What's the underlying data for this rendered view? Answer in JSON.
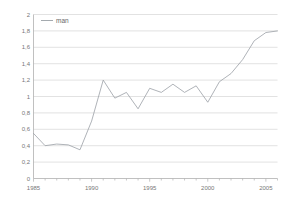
{
  "chart_data": {
    "type": "line",
    "title": "",
    "xlabel": "",
    "ylabel": "",
    "xlim": [
      1985,
      2006
    ],
    "ylim": [
      0,
      2
    ],
    "grid": true,
    "grid_axis": "y",
    "legend_position": "top-left",
    "series": [
      {
        "name": "man",
        "color": "#9aa0a6",
        "x": [
          1985,
          1986,
          1987,
          1988,
          1989,
          1990,
          1991,
          1992,
          1993,
          1994,
          1995,
          1996,
          1997,
          1998,
          1999,
          2000,
          2001,
          2002,
          2003,
          2004,
          2005,
          2006
        ],
        "values": [
          0.55,
          0.4,
          0.42,
          0.41,
          0.35,
          0.7,
          1.2,
          0.98,
          1.05,
          0.85,
          1.1,
          1.05,
          1.15,
          1.05,
          1.13,
          0.93,
          1.18,
          1.28,
          1.45,
          1.68,
          1.78,
          1.8
        ]
      }
    ],
    "y_ticks": [
      {
        "value": 0,
        "label": "0"
      },
      {
        "value": 0.2,
        "label": "0,2"
      },
      {
        "value": 0.4,
        "label": "0,4"
      },
      {
        "value": 0.6,
        "label": "0,6"
      },
      {
        "value": 0.8,
        "label": "0,8"
      },
      {
        "value": 1.0,
        "label": "1"
      },
      {
        "value": 1.2,
        "label": "1,2"
      },
      {
        "value": 1.4,
        "label": "1,4"
      },
      {
        "value": 1.6,
        "label": "1,6"
      },
      {
        "value": 1.8,
        "label": "1,8"
      },
      {
        "value": 2.0,
        "label": "2"
      }
    ],
    "x_ticks_major": [
      {
        "value": 1985,
        "label": "1985"
      },
      {
        "value": 1990,
        "label": "1990"
      },
      {
        "value": 1995,
        "label": "1995"
      },
      {
        "value": 2000,
        "label": "2000"
      },
      {
        "value": 2005,
        "label": "2005"
      }
    ],
    "x_ticks_minor": [
      1986,
      1987,
      1988,
      1989,
      1991,
      1992,
      1993,
      1994,
      1996,
      1997,
      1998,
      1999,
      2001,
      2002,
      2003,
      2004,
      2006
    ],
    "legend": [
      {
        "label": "man",
        "color": "#9aa0a6",
        "marker": "line"
      }
    ],
    "colors": {
      "series": "#9aa0a6",
      "grid": "#d6d6d6",
      "axis": "#b0b0b0",
      "tick_text": "#777777",
      "background": "#ffffff"
    }
  }
}
